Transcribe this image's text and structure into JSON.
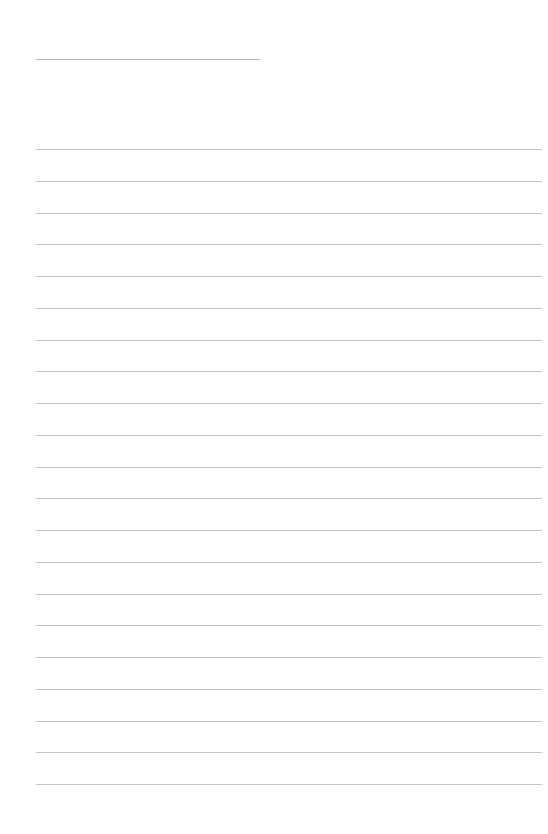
{
  "page": {
    "type": "lined-paper",
    "background_color": "#ffffff",
    "line_color": "#c4c4c4",
    "header_line": {
      "left": 36,
      "top": 59,
      "width": 224
    },
    "rules": {
      "count": 21,
      "left": 36,
      "width": 506,
      "first_top": 149,
      "spacing": 31.75
    }
  }
}
